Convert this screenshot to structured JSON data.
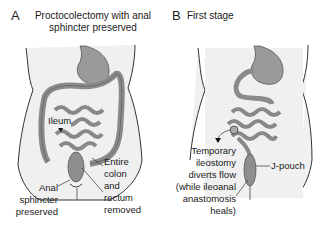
{
  "panels": [
    {
      "letter": "A",
      "title_line1": "Proctocolectomy with anal",
      "title_line2": "sphincter preserved",
      "labels": {
        "ileum": "Ileum",
        "anal_line1": "Anal",
        "anal_line2": "sphincter",
        "anal_line3": "preserved",
        "removed_line1": "Entire",
        "removed_line2": "colon",
        "removed_line3": "and",
        "removed_line4": "rectum",
        "removed_line5": "removed"
      }
    },
    {
      "letter": "B",
      "title": "First stage",
      "labels": {
        "ileo_line1": "Temporary",
        "ileo_line2": "ileostomy",
        "ileo_line3": "diverts flow",
        "ileo_line4": "(while ileoanal",
        "ileo_line5": "anastomosis",
        "ileo_line6": "heals)",
        "jpouch": "J-pouch"
      }
    }
  ],
  "colors": {
    "body_fill": "#efefef",
    "organ_fill": "#9a9a9a",
    "organ_dark": "#6e6e6e",
    "outline": "#333333",
    "text": "#1a1a1a"
  }
}
